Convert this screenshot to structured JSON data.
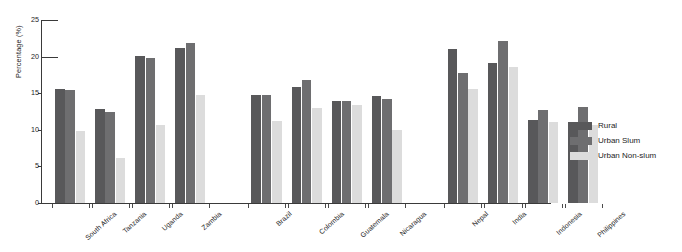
{
  "chart_data": {
    "type": "bar",
    "title": "",
    "subtitle": "",
    "xlabel": "",
    "ylabel": "Percentage (%)",
    "ylim": [
      0,
      25
    ],
    "yticks": [
      0,
      5,
      10,
      15,
      20,
      25
    ],
    "ytick_labels": [
      "0",
      "5",
      "10",
      "15",
      "20",
      "25"
    ],
    "grid": false,
    "legend_position": "right",
    "categories": [
      "South Africa",
      "Tanzania",
      "Uganda",
      "Zambia",
      "Brazil",
      "Colombia",
      "Guatemala",
      "Nicaragua",
      "Nepal",
      "India",
      "Indonesia",
      "Philippines"
    ],
    "groups": [
      {
        "name": "Africa",
        "categories": [
          "South Africa",
          "Tanzania",
          "Uganda",
          "Zambia"
        ]
      },
      {
        "name": "Latin America",
        "categories": [
          "Brazil",
          "Colombia",
          "Guatemala",
          "Nicaragua"
        ]
      },
      {
        "name": "Asia",
        "categories": [
          "Nepal",
          "India",
          "Indonesia",
          "Philippines"
        ]
      }
    ],
    "series": [
      {
        "name": "Rural",
        "color": "#58585a",
        "values": [
          15.6,
          12.9,
          20.1,
          21.2,
          14.8,
          15.8,
          13.9,
          14.6,
          21.1,
          19.1,
          11.3,
          11.1
        ]
      },
      {
        "name": "Urban Slum",
        "color": "#6e6e70",
        "values": [
          15.4,
          12.5,
          19.8,
          21.9,
          14.8,
          16.8,
          13.9,
          14.2,
          17.8,
          22.2,
          12.7,
          13.1
        ]
      },
      {
        "name": "Urban Non-slum",
        "color": "#dcdcdc",
        "values": [
          9.8,
          6.1,
          10.6,
          14.8,
          11.2,
          13.0,
          13.4,
          10.0,
          15.6,
          18.6,
          11.1,
          10.6
        ]
      }
    ]
  },
  "legend": {
    "items": [
      {
        "label": "Rural",
        "color": "#58585a"
      },
      {
        "label": "Urban Slum",
        "color": "#6e6e70"
      },
      {
        "label": "Urban Non-slum",
        "color": "#dcdcdc"
      }
    ]
  },
  "axes": {
    "y_title": "Percentage (%)",
    "y_tick_labels": [
      "0",
      "5",
      "10",
      "15",
      "20",
      "25"
    ]
  }
}
